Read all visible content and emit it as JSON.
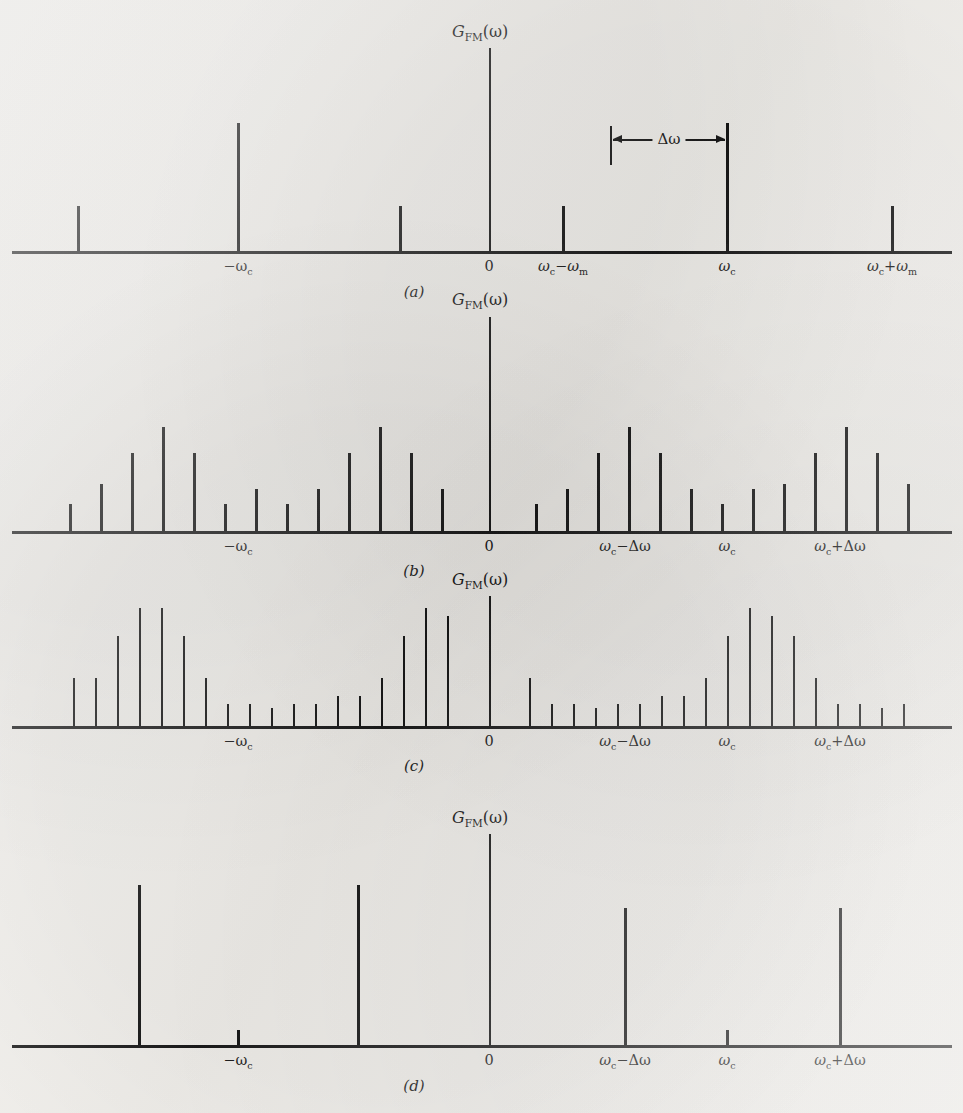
{
  "figure": {
    "axis_label": "G",
    "axis_label_sub": "FM",
    "axis_label_arg": "(ω)",
    "ink_color": "#161616",
    "paper_color": "#f2f0ec"
  },
  "panels": [
    {
      "caption": "(a)",
      "ylabel_text": "G",
      "ylabel_sub": "FM",
      "ylabel_arg": "(ω)",
      "xticks": [
        {
          "label": "−ω",
          "sub": "c",
          "x": 238
        },
        {
          "label": "0",
          "sub": "",
          "x": 489
        },
        {
          "label": "ω",
          "sub": "c",
          "label2": "−ω",
          "sub2": "m",
          "x": 563
        },
        {
          "label": "ω",
          "sub": "c",
          "x": 727
        },
        {
          "label": "ω",
          "sub": "c",
          "label2": "+ω",
          "sub2": "m",
          "x": 892
        }
      ],
      "annotation": {
        "text": "Δω",
        "from_x": 611,
        "to_x": 727
      }
    },
    {
      "caption": "(b)",
      "ylabel_text": "G",
      "ylabel_sub": "FM",
      "ylabel_arg": "(ω)",
      "xticks": [
        {
          "label": "−ω",
          "sub": "c",
          "x": 238
        },
        {
          "label": "0",
          "sub": "",
          "x": 489
        },
        {
          "label": "ω",
          "sub": "c",
          "label2": "−Δω",
          "sub2": "",
          "x": 625
        },
        {
          "label": "ω",
          "sub": "c",
          "x": 727
        },
        {
          "label": "ω",
          "sub": "c",
          "label2": "+Δω",
          "sub2": "",
          "x": 840
        }
      ]
    },
    {
      "caption": "(c)",
      "ylabel_text": "G",
      "ylabel_sub": "FM",
      "ylabel_arg": "(ω)",
      "xticks": [
        {
          "label": "−ω",
          "sub": "c",
          "x": 238
        },
        {
          "label": "0",
          "sub": "",
          "x": 489
        },
        {
          "label": "ω",
          "sub": "c",
          "label2": "−Δω",
          "sub2": "",
          "x": 625
        },
        {
          "label": "ω",
          "sub": "c",
          "x": 727
        },
        {
          "label": "ω",
          "sub": "c",
          "label2": "+Δω",
          "sub2": "",
          "x": 840
        }
      ]
    },
    {
      "caption": "(d)",
      "ylabel_text": "G",
      "ylabel_sub": "FM",
      "ylabel_arg": "(ω)",
      "xticks": [
        {
          "label": "−ω",
          "sub": "c",
          "x": 238
        },
        {
          "label": "0",
          "sub": "",
          "x": 489
        },
        {
          "label": "ω",
          "sub": "c",
          "label2": "−Δω",
          "sub2": "",
          "x": 625
        },
        {
          "label": "ω",
          "sub": "c",
          "x": 727
        },
        {
          "label": "ω",
          "sub": "c",
          "label2": "+Δω",
          "sub2": "",
          "x": 840
        }
      ]
    }
  ],
  "chart_data": [
    {
      "type": "bar",
      "title": "G_FM(ω)",
      "panel": "(a)",
      "note": "Narrowband FM: carrier plus single pair of sidebands at ±ωm",
      "xlabel": "ω",
      "ylabel": "G_FM(ω)",
      "grid": false,
      "legend": false,
      "axis_baseline_y": 253,
      "tick_positions": [
        78,
        238,
        400,
        563,
        727,
        892
      ],
      "x": [
        78,
        238,
        400,
        563,
        727,
        892
      ],
      "categories": [
        "-ωc-ωm",
        "-ωc",
        "-ωc+ωm",
        "ωc-ωm",
        "ωc",
        "ωc+ωm"
      ],
      "values": [
        45,
        128,
        45,
        45,
        128,
        45
      ],
      "ylim": [
        0,
        230
      ]
    },
    {
      "type": "bar",
      "title": "G_FM(ω)",
      "panel": "(b)",
      "note": "Moderate deviation: symmetric Bessel sideband cluster of 13 lines each side",
      "xlabel": "ω",
      "ylabel": "G_FM(ω)",
      "grid": false,
      "legend": false,
      "axis_baseline_y": 533,
      "x": [
        70,
        101,
        132,
        163,
        194,
        225,
        256,
        287,
        318,
        349,
        380,
        411,
        442,
        536,
        567,
        598,
        629,
        660,
        691,
        722,
        753,
        784,
        815,
        846,
        877,
        908
      ],
      "values": [
        27,
        47,
        78,
        104,
        78,
        27,
        42,
        27,
        42,
        78,
        104,
        78,
        42,
        27,
        42,
        78,
        104,
        78,
        42,
        27,
        42,
        47,
        78,
        104,
        78,
        47,
        27
      ],
      "ylim": [
        0,
        170
      ]
    },
    {
      "type": "bar",
      "title": "G_FM(ω)",
      "panel": "(c)",
      "note": "Large deviation: energy concentrated near ωc±Δω, dip at ωc",
      "xlabel": "ω",
      "ylabel": "G_FM(ω)",
      "grid": false,
      "legend": false,
      "axis_baseline_y": 728,
      "x": [
        74,
        96,
        118,
        140,
        162,
        184,
        206,
        228,
        250,
        272,
        294,
        316,
        338,
        360,
        382,
        404,
        426,
        448,
        530,
        552,
        574,
        596,
        618,
        640,
        662,
        684,
        706,
        728,
        750,
        772,
        794,
        816,
        838,
        860,
        882,
        904
      ],
      "values": [
        48,
        48,
        90,
        118,
        118,
        90,
        48,
        22,
        22,
        18,
        22,
        22,
        30,
        30,
        48,
        90,
        118,
        110,
        48,
        22,
        22,
        18,
        22,
        22,
        30,
        30,
        48,
        90,
        118,
        110,
        90,
        48,
        22,
        22,
        18,
        22
      ],
      "ylim": [
        0,
        150
      ]
    },
    {
      "type": "bar",
      "title": "G_FM(ω)",
      "panel": "(d)",
      "note": "Very large deviation: two dominant lines at ωc±Δω and vestigial carrier at ωc",
      "xlabel": "ω",
      "ylabel": "G_FM(ω)",
      "grid": false,
      "legend": false,
      "axis_baseline_y": 1047,
      "x": [
        139,
        238,
        358,
        625,
        727,
        840
      ],
      "categories": [
        "-ωc-Δω",
        "-ωc",
        "-ωc+Δω",
        "ωc-Δω",
        "ωc",
        "ωc+Δω"
      ],
      "values": [
        160,
        15,
        160,
        137,
        15,
        137
      ],
      "ylim": [
        0,
        230
      ]
    }
  ]
}
